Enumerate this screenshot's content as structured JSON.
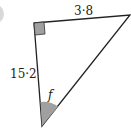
{
  "diagram": {
    "type": "right-triangle",
    "labels": {
      "top_side": "3·8",
      "left_side": "15·2",
      "angle": "f"
    },
    "colors": {
      "stroke": "#222222",
      "fill_marker": "#a0a0a0"
    }
  }
}
